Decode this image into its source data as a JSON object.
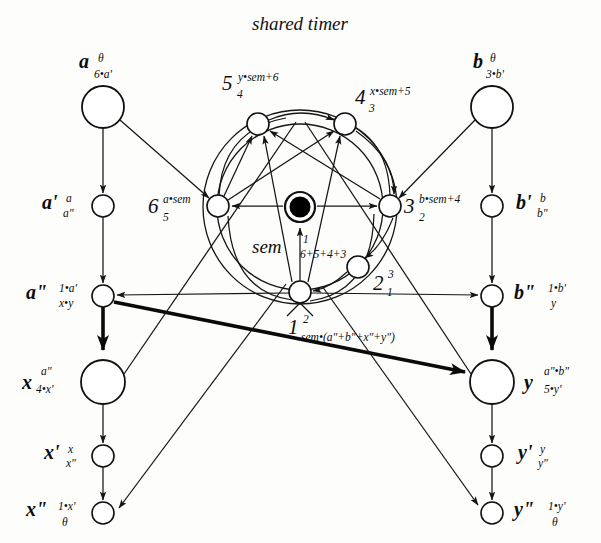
{
  "title": "shared timer",
  "diagram": {
    "kind": "petri-net"
  },
  "places": [
    {
      "id": "a",
      "name": "a",
      "sup": "θ",
      "sub": "6•a'",
      "cx": 103,
      "cy": 107,
      "r": 21,
      "label_side": "above"
    },
    {
      "id": "b",
      "name": "b",
      "sup": "θ",
      "sub": "3•b'",
      "cx": 492,
      "cy": 107,
      "r": 21,
      "label_side": "above"
    },
    {
      "id": "ap",
      "name": "a'",
      "sup": "a",
      "sub": "a\"",
      "cx": 103,
      "cy": 206,
      "r": 11,
      "label_side": "left"
    },
    {
      "id": "bp",
      "name": "b'",
      "sup": "b",
      "sub": "b\"",
      "cx": 492,
      "cy": 206,
      "r": 11,
      "label_side": "right"
    },
    {
      "id": "app",
      "name": "a\"",
      "sup": "1•a'",
      "sub": "x•y",
      "cx": 103,
      "cy": 296,
      "r": 11,
      "label_side": "left"
    },
    {
      "id": "bpp",
      "name": "b\"",
      "sup": "1•b'",
      "sub": "y",
      "cx": 492,
      "cy": 296,
      "r": 11,
      "label_side": "right"
    },
    {
      "id": "x",
      "name": "x",
      "sup": "a\"",
      "sub": "4•x'",
      "cx": 103,
      "cy": 382,
      "r": 22,
      "label_side": "left"
    },
    {
      "id": "y",
      "name": "y",
      "sup": "a\"•b\"",
      "sub": "5•y'",
      "cx": 492,
      "cy": 382,
      "r": 22,
      "label_side": "right"
    },
    {
      "id": "xp",
      "name": "x'",
      "sup": "x",
      "sub": "x\"",
      "cx": 103,
      "cy": 456,
      "r": 11,
      "label_side": "left"
    },
    {
      "id": "yp",
      "name": "y'",
      "sup": "y",
      "sub": "y\"",
      "cx": 492,
      "cy": 456,
      "r": 11,
      "label_side": "right"
    },
    {
      "id": "xpp",
      "name": "x\"",
      "sup": "1•x'",
      "sub": "θ",
      "cx": 103,
      "cy": 513,
      "r": 11,
      "label_side": "left"
    },
    {
      "id": "ypp",
      "name": "y\"",
      "sup": "1•y'",
      "sub": "θ",
      "cx": 492,
      "cy": 513,
      "r": 11,
      "label_side": "right"
    },
    {
      "id": "n5",
      "name": "5",
      "sup": "y•sem+6",
      "sub": "4",
      "cx": 258,
      "cy": 124,
      "r": 11,
      "label_side": "above-left"
    },
    {
      "id": "n4",
      "name": "4",
      "sup": "x•sem+5",
      "sub": "3",
      "cx": 345,
      "cy": 124,
      "r": 11,
      "label_side": "above-right"
    },
    {
      "id": "n6",
      "name": "6",
      "sup": "a•sem",
      "sub": "5",
      "cx": 218,
      "cy": 206,
      "r": 11,
      "label_side": "left"
    },
    {
      "id": "n3",
      "name": "3",
      "sup": "b•sem+4",
      "sub": "2",
      "cx": 390,
      "cy": 206,
      "r": 11,
      "label_side": "right"
    },
    {
      "id": "n2",
      "name": "2",
      "sup": "3",
      "sub": "1",
      "cx": 358,
      "cy": 267,
      "r": 11,
      "label_side": "right"
    },
    {
      "id": "n1",
      "name": "1",
      "sup": "2",
      "sub": "sem•(a\"+b\"+x\"+y\")",
      "cx": 300,
      "cy": 292,
      "r": 11,
      "label_side": "below"
    },
    {
      "id": "sem",
      "name": "sem",
      "sup": "1",
      "sub": "6+5+4+3",
      "cx": 300,
      "cy": 207,
      "r": 14,
      "label_side": "below-left",
      "marked": true
    }
  ],
  "rings": [
    {
      "id": "outer-ring",
      "cx": 300,
      "cy": 207,
      "r": 97
    },
    {
      "id": "inner-ring",
      "cx": 300,
      "cy": 207,
      "r": 83
    }
  ],
  "labels": {
    "title": "shared timer",
    "sem_word": "sem"
  },
  "colors": {
    "ink": "#151515",
    "paper": "#fdfdfc",
    "token": "#000000"
  }
}
